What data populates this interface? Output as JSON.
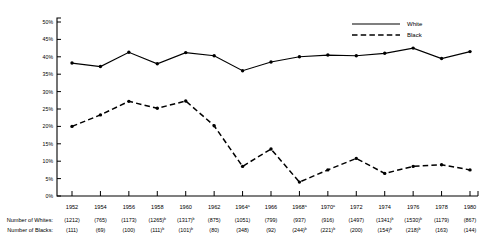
{
  "chart_data": {
    "type": "line",
    "title": "",
    "xlabel": "",
    "ylabel": "",
    "ylim": [
      0,
      50
    ],
    "ytick_labels": [
      "50%",
      "45%",
      "40%",
      "35%",
      "30%",
      "25%",
      "20%",
      "15%",
      "10%",
      "5%",
      "0%"
    ],
    "ytick_values": [
      50,
      45,
      40,
      35,
      30,
      25,
      20,
      15,
      10,
      5,
      0
    ],
    "grid": false,
    "legend_position": "top-right",
    "categories": [
      "1952",
      "1954",
      "1956",
      "1958",
      "1960",
      "1962",
      "1964",
      "1966",
      "1968",
      "1970",
      "1972",
      "1974",
      "1976",
      "1978",
      "1980"
    ],
    "category_superscripts": [
      "",
      "",
      "",
      "",
      "",
      "",
      "a",
      "",
      "a",
      "a",
      "",
      "",
      "",
      "",
      ""
    ],
    "series": [
      {
        "name": "White",
        "style": "solid",
        "values": [
          38.2,
          37.2,
          41.3,
          38.0,
          41.2,
          40.3,
          36.0,
          38.5,
          40.0,
          40.5,
          40.3,
          41.0,
          42.5,
          39.5,
          41.5
        ]
      },
      {
        "name": "Black",
        "style": "dashed",
        "values": [
          20.0,
          23.3,
          27.2,
          25.2,
          27.3,
          20.2,
          8.5,
          13.5,
          4.0,
          7.5,
          10.8,
          6.5,
          8.5,
          9.0,
          7.5
        ]
      }
    ],
    "annotation_rows": [
      {
        "label": "Number of Whites:",
        "values": [
          "(1212)",
          "(765)",
          "(1173)",
          "(1265)",
          "(1317)",
          "(875)",
          "(1051)",
          "(799)",
          "(937)",
          "(916)",
          "(1497)",
          "(1341)",
          "(1530)",
          "(1179)",
          "(867)"
        ],
        "superscripts": [
          "",
          "",
          "",
          "b",
          "b",
          "",
          "",
          "",
          "",
          "",
          "",
          "b",
          "b",
          "",
          ""
        ]
      },
      {
        "label": "Number of Blacks:",
        "values": [
          "(111)",
          "(69)",
          "(100)",
          "(111)",
          "(101)",
          "(80)",
          "(348)",
          "(92)",
          "(244)",
          "(221)",
          "(200)",
          "(154)",
          "(218)",
          "(163)",
          "(144)"
        ],
        "superscripts": [
          "",
          "",
          "",
          "b",
          "b",
          "",
          "",
          "",
          "b",
          "b",
          "",
          "b",
          "b",
          "",
          ""
        ]
      }
    ]
  },
  "legend": {
    "items": [
      {
        "label": "White",
        "style": "solid"
      },
      {
        "label": "Black",
        "style": "dashed"
      }
    ]
  }
}
